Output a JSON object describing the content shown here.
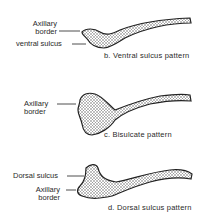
{
  "panels": [
    {
      "id": "b",
      "caption": "b. Ventral sulcus pattern",
      "labels": [
        {
          "line1": "Axillary",
          "line2": "border"
        },
        {
          "line1": "ventral sulcus"
        }
      ]
    },
    {
      "id": "c",
      "caption": "c. Bisulcate pattern",
      "labels": [
        {
          "line1": "Axillary",
          "line2": "border"
        }
      ]
    },
    {
      "id": "d",
      "caption": "d. Dorsal sulcus pattern",
      "labels": [
        {
          "line1": "Dorsal sulcus"
        },
        {
          "line1": "Axillary",
          "line2": "border"
        }
      ]
    }
  ],
  "colors": {
    "outline": "#222222",
    "fill": "#cfcfcf",
    "background": "#ffffff"
  }
}
